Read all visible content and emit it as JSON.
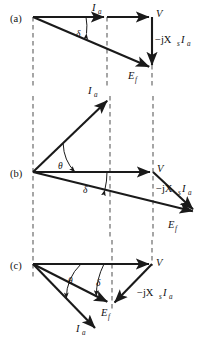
{
  "figure": {
    "background_color": "#ffffff",
    "stroke_color": "#1a1a1a",
    "dash_color": "#5d5d5d",
    "width": 209,
    "height": 343
  },
  "panels": [
    {
      "id": "a",
      "label": "(a)",
      "label_x": 10,
      "label_y": 22,
      "origin_x": 33,
      "origin_y": 17,
      "description": "unity power factor phasor diagram",
      "vectors": [
        {
          "name": "Ia",
          "label_main": "I",
          "label_sub": "a",
          "label_x": 94,
          "label_y": 10,
          "x1": 33,
          "y1": 17,
          "x2": 107,
          "y2": 17,
          "arrow": true
        },
        {
          "name": "V",
          "label_main": "V",
          "label_sub": "",
          "label_x": 157,
          "label_y": 17,
          "x1": 107,
          "y1": 17,
          "x2": 152,
          "y2": 17,
          "arrow": true
        },
        {
          "name": "jXsIa",
          "label_main": "−jX",
          "label_sub": "s",
          "label_main2": "I",
          "label_sub2": "a",
          "label_x": 155,
          "label_y": 41,
          "x1": 152,
          "y1": 17,
          "x2": 152,
          "y2": 68,
          "arrow": true
        },
        {
          "name": "Ef",
          "label_main": "E",
          "label_sub": "f",
          "label_x": 129,
          "label_y": 77,
          "x1": 33,
          "y1": 17,
          "x2": 152,
          "y2": 68,
          "arrow": true
        }
      ],
      "angles": [
        {
          "name": "delta",
          "symbol": "δ",
          "label_x": 78,
          "label_y": 37,
          "arc_cx": 33,
          "arc_cy": 17,
          "arc_r": 53,
          "from_deg": 0,
          "to_deg": 23
        }
      ],
      "dashed_lines": [
        {
          "x": 33,
          "y1": 17,
          "y2": 88
        },
        {
          "x": 107,
          "y1": 17,
          "y2": 88
        },
        {
          "x": 152,
          "y1": 17,
          "y2": 88
        }
      ]
    },
    {
      "id": "b",
      "label": "(b)",
      "label_x": 10,
      "label_y": 177,
      "origin_x": 33,
      "origin_y": 172,
      "description": "lagging power factor phasor diagram",
      "vectors": [
        {
          "name": "Ia",
          "label_main": "I",
          "label_sub": "a",
          "label_x": 90,
          "label_y": 93,
          "x1": 33,
          "y1": 172,
          "x2": 110,
          "y2": 98,
          "arrow": true
        },
        {
          "name": "V",
          "label_main": "V",
          "label_sub": "",
          "label_x": 158,
          "label_y": 172,
          "x1": 33,
          "y1": 172,
          "x2": 153,
          "y2": 172,
          "arrow": true
        },
        {
          "name": "jXsIa",
          "label_main": "−jX",
          "label_sub": "s",
          "label_main2": "I",
          "label_sub2": "a",
          "label_x": 156,
          "label_y": 190,
          "x1": 153,
          "y1": 172,
          "x2": 196,
          "y2": 212,
          "arrow": true
        },
        {
          "name": "Ef",
          "label_main": "E",
          "label_sub": "f",
          "label_x": 170,
          "label_y": 226,
          "x1": 33,
          "y1": 172,
          "x2": 196,
          "y2": 212,
          "arrow": true
        }
      ],
      "angles": [
        {
          "name": "theta",
          "symbol": "θ",
          "label_x": 60,
          "label_y": 168,
          "arc_cx": 33,
          "arc_cy": 172,
          "arc_r": 42,
          "from_deg": 0,
          "to_deg": 44
        },
        {
          "name": "delta",
          "symbol": "δ",
          "label_x": 84,
          "label_y": 192,
          "arc_cx": 33,
          "arc_cy": 172,
          "arc_r": 74,
          "from_deg": 0,
          "to_deg": 14
        }
      ],
      "dashed_lines": [
        {
          "x": 33,
          "y1": 96,
          "y2": 238
        },
        {
          "x": 110,
          "y1": 96,
          "y2": 238
        },
        {
          "x": 153,
          "y1": 96,
          "y2": 238
        }
      ]
    },
    {
      "id": "c",
      "label": "(c)",
      "label_x": 10,
      "label_y": 269,
      "origin_x": 33,
      "origin_y": 264,
      "description": "leading power factor phasor diagram",
      "vectors": [
        {
          "name": "V",
          "label_main": "V",
          "label_sub": "",
          "label_x": 157,
          "label_y": 264,
          "x1": 33,
          "y1": 264,
          "x2": 152,
          "y2": 264,
          "arrow": true
        },
        {
          "name": "jXsIa",
          "label_main": "−jX",
          "label_sub": "s",
          "label_main2": "I",
          "label_sub2": "a",
          "label_x": 138,
          "label_y": 294,
          "x1": 152,
          "y1": 264,
          "x2": 112,
          "y2": 305,
          "arrow": true
        },
        {
          "name": "Ef",
          "label_main": "E",
          "label_sub": "f",
          "label_x": 103,
          "label_y": 315,
          "x1": 33,
          "y1": 264,
          "x2": 110,
          "y2": 303,
          "arrow": true
        },
        {
          "name": "Ia",
          "label_main": "I",
          "label_sub": "a",
          "label_x": 78,
          "label_y": 330,
          "x1": 33,
          "y1": 264,
          "x2": 98,
          "y2": 331,
          "arrow": true
        }
      ],
      "angles": [
        {
          "name": "theta",
          "symbol": "θ",
          "label_x": 71,
          "label_y": 282,
          "arc_cx": 33,
          "arc_cy": 264,
          "arc_r": 48,
          "from_deg": 0,
          "to_deg": 46
        },
        {
          "name": "delta",
          "symbol": "δ",
          "label_x": 98,
          "label_y": 284,
          "arc_cx": 33,
          "arc_cy": 264,
          "arc_r": 71,
          "from_deg": 0,
          "to_deg": 27
        }
      ],
      "dashed_lines": [
        {
          "x": 33,
          "y1": 240,
          "y2": 280
        },
        {
          "x": 112,
          "y1": 240,
          "y2": 312
        },
        {
          "x": 152,
          "y1": 240,
          "y2": 266
        }
      ]
    }
  ],
  "labels": {
    "panel_a": "(a)",
    "panel_b": "(b)",
    "panel_c": "(c)",
    "voltage": "V",
    "current_main": "I",
    "current_sub": "a",
    "emf_main": "E",
    "emf_sub": "f",
    "reactance_drop_main": "−jX",
    "reactance_drop_sub": "s",
    "reactance_drop_main2": "I",
    "reactance_drop_sub2": "a",
    "theta": "θ",
    "delta": "δ"
  }
}
